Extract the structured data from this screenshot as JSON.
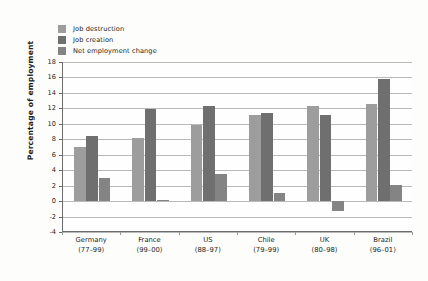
{
  "chart_data": {
    "type": "bar",
    "title": "",
    "subtitle": "",
    "xlabel": "",
    "ylabel": "Percentage of employment",
    "ylim": [
      -4,
      18
    ],
    "ytick_step": 2,
    "yticks": [
      18,
      16,
      14,
      12,
      10,
      8,
      6,
      4,
      2,
      0,
      -2,
      -4
    ],
    "ytick_labels": [
      "18",
      "16",
      "14",
      "12",
      "10",
      "8",
      "6",
      "4",
      "2",
      "0",
      "-2",
      "-4"
    ],
    "grid": "horizontal",
    "legend_position": "top-left",
    "categories": [
      "Germany",
      "France",
      "US",
      "Chile",
      "UK",
      "Brazil"
    ],
    "category_sublabels": [
      "(77–99)",
      "(99–00)",
      "(88–97)",
      "(79–99)",
      "(80–98)",
      "(96–01)"
    ],
    "category_labels": [
      {
        "name": "Germany",
        "years": "(77–99)"
      },
      {
        "name": "France",
        "years": "(99–00)"
      },
      {
        "name": "US",
        "years": "(88–97)"
      },
      {
        "name": "Chile",
        "years": "(79–99)"
      },
      {
        "name": "UK",
        "years": "(80–98)"
      },
      {
        "name": "Brazil",
        "years": "(96–01)"
      }
    ],
    "series": [
      {
        "name": "Job destruction",
        "color": "#9d9d9d",
        "values": [
          7.0,
          8.2,
          9.9,
          11.1,
          12.3,
          12.6
        ]
      },
      {
        "name": "Job creation",
        "color": "#6f6f6f",
        "values": [
          8.4,
          11.9,
          12.3,
          11.4,
          11.2,
          15.8
        ]
      },
      {
        "name": "Net employment change",
        "color": "#848484",
        "values": [
          3.0,
          0.2,
          3.5,
          1.1,
          -1.3,
          2.1
        ]
      }
    ]
  },
  "legend": {
    "items": [
      {
        "label": "Job destruction",
        "color": "#9d9d9d"
      },
      {
        "label": "Job creation",
        "color": "#6f6f6f"
      },
      {
        "label": "Net employment change",
        "color": "#848484"
      }
    ]
  },
  "axes": {
    "y_title": "Percentage of employment"
  },
  "colors": {
    "grid": "#b9b9b9",
    "axis": "#6d6d6d",
    "text": "#231f20",
    "background": "#fdfdfc"
  }
}
